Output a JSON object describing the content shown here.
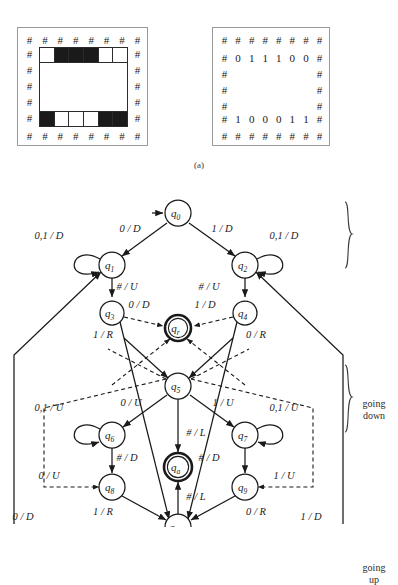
{
  "figure": {
    "caption_a": "(a)"
  },
  "tape_left": {
    "hash_symbol": "#",
    "top_hash_count": 8,
    "bottom_hash_count": 8,
    "side_hash_count": 5,
    "top_row_cells": [
      "white",
      "black",
      "black",
      "black",
      "white",
      "white"
    ],
    "bottom_row_cells": [
      "black",
      "white",
      "white",
      "white",
      "black",
      "black"
    ]
  },
  "tape_right": {
    "hash_symbol": "#",
    "top_hash_count": 8,
    "bottom_hash_count": 8,
    "side_hash_count": 3,
    "top_row_digits": [
      "0",
      "1",
      "1",
      "1",
      "0",
      "0"
    ],
    "bottom_row_digits": [
      "1",
      "0",
      "0",
      "0",
      "1",
      "1"
    ]
  },
  "diagram": {
    "phase_labels": {
      "going_down": "going\ndown",
      "going_down_line1": "going",
      "going_down_line2": "down",
      "going_up_line1": "going",
      "going_up_line2": "up"
    },
    "states": [
      {
        "id": "q0",
        "label": "q",
        "sub": "0",
        "cx": 178,
        "cy": 33,
        "r": 13,
        "accept": false
      },
      {
        "id": "q1",
        "label": "q",
        "sub": "1",
        "cx": 112,
        "cy": 85,
        "r": 13,
        "accept": false
      },
      {
        "id": "q2",
        "label": "q",
        "sub": "2",
        "cx": 245,
        "cy": 85,
        "r": 13,
        "accept": false
      },
      {
        "id": "q3",
        "label": "q",
        "sub": "3",
        "cx": 112,
        "cy": 133,
        "r": 12,
        "accept": false
      },
      {
        "id": "q4",
        "label": "q",
        "sub": "4",
        "cx": 245,
        "cy": 133,
        "r": 12,
        "accept": false
      },
      {
        "id": "qr",
        "label": "q",
        "sub": "r",
        "cx": 178,
        "cy": 148,
        "r": 13,
        "accept": true
      },
      {
        "id": "q5",
        "label": "q",
        "sub": "5",
        "cx": 178,
        "cy": 206,
        "r": 13,
        "accept": false
      },
      {
        "id": "q6",
        "label": "q",
        "sub": "6",
        "cx": 112,
        "cy": 255,
        "r": 13,
        "accept": false
      },
      {
        "id": "q7",
        "label": "q",
        "sub": "7",
        "cx": 245,
        "cy": 255,
        "r": 13,
        "accept": false
      },
      {
        "id": "qa",
        "label": "q",
        "sub": "a",
        "cx": 178,
        "cy": 287,
        "r": 14,
        "accept": true
      },
      {
        "id": "q8",
        "label": "q",
        "sub": "8",
        "cx": 112,
        "cy": 307,
        "r": 13,
        "accept": false
      },
      {
        "id": "q9",
        "label": "q",
        "sub": "9",
        "cx": 245,
        "cy": 307,
        "r": 13,
        "accept": false
      },
      {
        "id": "q10",
        "label": "q",
        "sub": "10",
        "cx": 178,
        "cy": 347,
        "r": 13,
        "accept": false
      }
    ],
    "transition_labels": [
      {
        "id": "t-q0-q1",
        "text": "0 / D",
        "x": 130,
        "y": 52
      },
      {
        "id": "t-q0-q2",
        "text": "1 / D",
        "x": 222,
        "y": 52
      },
      {
        "id": "t-q1-loop",
        "text": "0,1 / D",
        "x": 49,
        "y": 59
      },
      {
        "id": "t-q2-loop",
        "text": "0,1 / D",
        "x": 284,
        "y": 59
      },
      {
        "id": "t-q1-q3",
        "text": "# / U",
        "x": 127,
        "y": 110
      },
      {
        "id": "t-q2-q4",
        "text": "# / U",
        "x": 209,
        "y": 110
      },
      {
        "id": "t-q3-qr",
        "text": "0 / D",
        "x": 139,
        "y": 128
      },
      {
        "id": "t-q4-qr",
        "text": "1 / D",
        "x": 205,
        "y": 128
      },
      {
        "id": "t-q3-q10",
        "text": "1 / R",
        "x": 103,
        "y": 158
      },
      {
        "id": "t-q4-q10",
        "text": "0 / R",
        "x": 256,
        "y": 158
      },
      {
        "id": "t-q5-q6",
        "text": "0 / U",
        "x": 131,
        "y": 226
      },
      {
        "id": "t-q5-q7",
        "text": "1 / U",
        "x": 223,
        "y": 226
      },
      {
        "id": "t-q6-loop",
        "text": "0,1 / U",
        "x": 49,
        "y": 231
      },
      {
        "id": "t-q7-loop",
        "text": "0,1 / U",
        "x": 284,
        "y": 231
      },
      {
        "id": "t-q5-qa",
        "text": "# / L",
        "x": 196,
        "y": 256
      },
      {
        "id": "t-q6-q8",
        "text": "# / D",
        "x": 127,
        "y": 281
      },
      {
        "id": "t-q7-q9",
        "text": "# / D",
        "x": 209,
        "y": 281
      },
      {
        "id": "t-dash-left",
        "text": "0 / U",
        "x": 49,
        "y": 299
      },
      {
        "id": "t-dash-right",
        "text": "1 / U",
        "x": 284,
        "y": 299
      },
      {
        "id": "t-q10-qa",
        "text": "# / L",
        "x": 196,
        "y": 320
      },
      {
        "id": "t-q8-q10",
        "text": "1 / R",
        "x": 103,
        "y": 335
      },
      {
        "id": "t-q9-q10",
        "text": "0 / R",
        "x": 256,
        "y": 335
      },
      {
        "id": "t-outer-left",
        "text": "0 / D",
        "x": 23,
        "y": 340
      },
      {
        "id": "t-outer-right",
        "text": "1 / D",
        "x": 311,
        "y": 340
      }
    ]
  }
}
